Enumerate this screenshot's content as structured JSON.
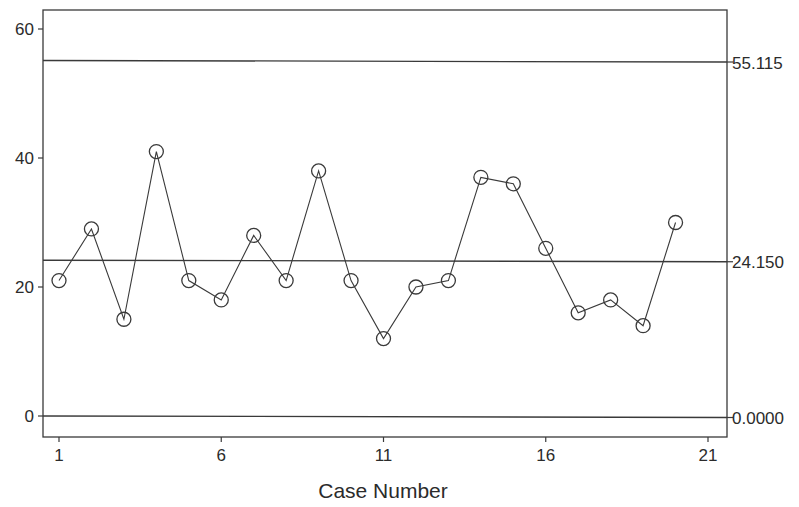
{
  "chart_data": {
    "type": "line",
    "title": "",
    "xlabel": "Case Number",
    "ylabel": "",
    "x": [
      1,
      2,
      3,
      4,
      5,
      6,
      7,
      8,
      9,
      10,
      11,
      12,
      13,
      14,
      15,
      16,
      17,
      18,
      19,
      20
    ],
    "series": [
      {
        "name": "Observations",
        "marker": "open-circle",
        "values": [
          21,
          29,
          15,
          41,
          21,
          18,
          28,
          21,
          38,
          21,
          12,
          20,
          21,
          37,
          36,
          26,
          16,
          18,
          14,
          30
        ]
      }
    ],
    "control_lines": [
      {
        "name": "UCL",
        "value": 55.115,
        "label": "55.115"
      },
      {
        "name": "Center",
        "value": 24.15,
        "label": "24.150"
      },
      {
        "name": "LCL",
        "value": 0.0,
        "label": "0.0000"
      }
    ],
    "xticks": [
      "1",
      "6",
      "11",
      "16",
      "21"
    ],
    "yticks": [
      "0",
      "20",
      "40",
      "60"
    ],
    "xlim": [
      0.5,
      21.6
    ],
    "ylim": [
      -3,
      63
    ],
    "grid": false,
    "legend": "none"
  },
  "colors": {
    "line": "#3a3a3a",
    "background": "#ffffff"
  }
}
